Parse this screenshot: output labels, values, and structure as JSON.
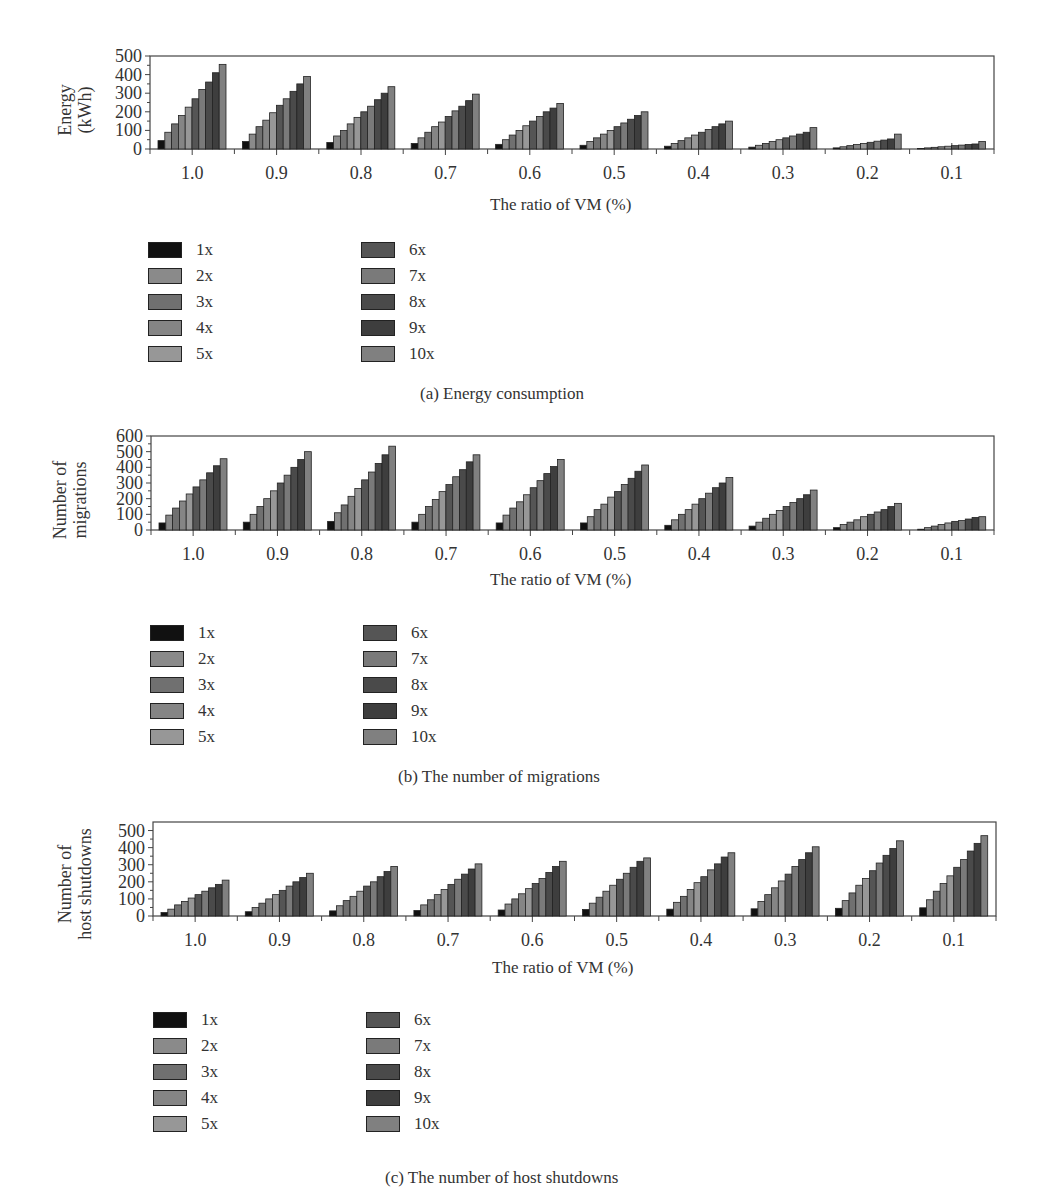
{
  "figure": {
    "colors": [
      "#111111",
      "#8a8a8a",
      "#707070",
      "#858585",
      "#979797",
      "#555555",
      "#7a7a7a",
      "#4a4a4a",
      "#3e3e3e",
      "#808080"
    ]
  },
  "chart_data": [
    {
      "id": "a",
      "type": "bar",
      "caption": "(a)  Energy consumption",
      "xlabel": "The ratio of VM (%)",
      "ylabel_lines": [
        "Energy",
        "(kWh)"
      ],
      "ylim": [
        0,
        500
      ],
      "yticks": [
        0,
        100,
        200,
        300,
        400,
        500
      ],
      "categories": [
        "1.0",
        "0.9",
        "0.8",
        "0.7",
        "0.6",
        "0.5",
        "0.4",
        "0.3",
        "0.2",
        "0.1"
      ],
      "series": [
        {
          "name": "1x",
          "values": [
            45,
            40,
            35,
            30,
            25,
            20,
            15,
            10,
            6,
            3
          ]
        },
        {
          "name": "2x",
          "values": [
            90,
            80,
            70,
            60,
            50,
            40,
            30,
            20,
            12,
            6
          ]
        },
        {
          "name": "3x",
          "values": [
            135,
            120,
            100,
            90,
            75,
            60,
            45,
            30,
            18,
            9
          ]
        },
        {
          "name": "4x",
          "values": [
            180,
            155,
            135,
            120,
            100,
            80,
            60,
            40,
            24,
            12
          ]
        },
        {
          "name": "5x",
          "values": [
            225,
            195,
            170,
            145,
            125,
            100,
            75,
            50,
            30,
            15
          ]
        },
        {
          "name": "6x",
          "values": [
            270,
            235,
            200,
            175,
            150,
            120,
            90,
            60,
            36,
            18
          ]
        },
        {
          "name": "7x",
          "values": [
            320,
            270,
            230,
            205,
            175,
            140,
            105,
            70,
            42,
            21
          ]
        },
        {
          "name": "8x",
          "values": [
            360,
            310,
            265,
            230,
            200,
            160,
            120,
            80,
            48,
            24
          ]
        },
        {
          "name": "9x",
          "values": [
            410,
            350,
            300,
            260,
            220,
            180,
            135,
            90,
            54,
            27
          ]
        },
        {
          "name": "10x",
          "values": [
            455,
            390,
            335,
            295,
            245,
            200,
            150,
            115,
            80,
            40
          ]
        }
      ]
    },
    {
      "id": "b",
      "type": "bar",
      "caption": "(b)  The number of migrations",
      "xlabel": "The ratio of VM (%)",
      "ylabel_lines": [
        "Number of",
        "migrations"
      ],
      "ylim": [
        0,
        600
      ],
      "yticks": [
        0,
        100,
        200,
        300,
        400,
        500,
        600
      ],
      "categories": [
        "1.0",
        "0.9",
        "0.8",
        "0.7",
        "0.6",
        "0.5",
        "0.4",
        "0.3",
        "0.2",
        "0.1"
      ],
      "series": [
        {
          "name": "1x",
          "values": [
            45,
            50,
            55,
            50,
            45,
            45,
            30,
            25,
            15,
            5
          ]
        },
        {
          "name": "2x",
          "values": [
            95,
            100,
            110,
            100,
            95,
            85,
            65,
            50,
            35,
            15
          ]
        },
        {
          "name": "3x",
          "values": [
            140,
            150,
            160,
            150,
            140,
            130,
            100,
            75,
            50,
            25
          ]
        },
        {
          "name": "4x",
          "values": [
            185,
            200,
            215,
            195,
            180,
            165,
            130,
            100,
            65,
            35
          ]
        },
        {
          "name": "5x",
          "values": [
            230,
            250,
            265,
            245,
            225,
            210,
            165,
            125,
            85,
            45
          ]
        },
        {
          "name": "6x",
          "values": [
            275,
            300,
            320,
            290,
            270,
            245,
            200,
            150,
            100,
            55
          ]
        },
        {
          "name": "7x",
          "values": [
            320,
            350,
            370,
            340,
            315,
            290,
            235,
            175,
            115,
            60
          ]
        },
        {
          "name": "8x",
          "values": [
            365,
            400,
            425,
            385,
            360,
            330,
            270,
            200,
            130,
            70
          ]
        },
        {
          "name": "9x",
          "values": [
            410,
            450,
            480,
            435,
            405,
            375,
            300,
            225,
            150,
            80
          ]
        },
        {
          "name": "10x",
          "values": [
            455,
            500,
            535,
            480,
            450,
            415,
            335,
            255,
            170,
            85
          ]
        }
      ]
    },
    {
      "id": "c",
      "type": "bar",
      "caption": "(c)  The number of host shutdowns",
      "xlabel": "The ratio of VM (%)",
      "ylabel_lines": [
        "Number of",
        "host shutdowns"
      ],
      "ylim": [
        0,
        550
      ],
      "yticks": [
        0,
        100,
        200,
        300,
        400,
        500
      ],
      "categories": [
        "1.0",
        "0.9",
        "0.8",
        "0.7",
        "0.6",
        "0.5",
        "0.4",
        "0.3",
        "0.2",
        "0.1"
      ],
      "series": [
        {
          "name": "1x",
          "values": [
            20,
            25,
            30,
            32,
            35,
            38,
            40,
            42,
            45,
            48
          ]
        },
        {
          "name": "2x",
          "values": [
            40,
            50,
            60,
            65,
            70,
            75,
            80,
            85,
            90,
            95
          ]
        },
        {
          "name": "3x",
          "values": [
            65,
            75,
            90,
            95,
            100,
            110,
            115,
            125,
            135,
            145
          ]
        },
        {
          "name": "4x",
          "values": [
            85,
            100,
            115,
            125,
            130,
            145,
            155,
            165,
            180,
            190
          ]
        },
        {
          "name": "5x",
          "values": [
            105,
            125,
            145,
            155,
            160,
            180,
            195,
            205,
            220,
            235
          ]
        },
        {
          "name": "6x",
          "values": [
            125,
            150,
            175,
            185,
            190,
            215,
            230,
            245,
            265,
            285
          ]
        },
        {
          "name": "7x",
          "values": [
            145,
            175,
            200,
            215,
            220,
            250,
            270,
            290,
            310,
            330
          ]
        },
        {
          "name": "8x",
          "values": [
            165,
            200,
            230,
            245,
            255,
            285,
            305,
            330,
            355,
            380
          ]
        },
        {
          "name": "9x",
          "values": [
            185,
            225,
            260,
            275,
            290,
            320,
            345,
            370,
            395,
            425
          ]
        },
        {
          "name": "10x",
          "values": [
            210,
            250,
            290,
            305,
            320,
            340,
            370,
            405,
            440,
            470
          ]
        }
      ]
    }
  ]
}
